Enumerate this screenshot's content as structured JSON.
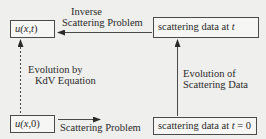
{
  "diagram": {
    "type": "flow",
    "nodes": {
      "u_xt": {
        "prefix": "u(",
        "var1": "x",
        "sep": ", ",
        "var2": "t",
        "suffix": ")"
      },
      "u_x0": {
        "prefix": "u(",
        "var1": "x",
        "sep": ", ",
        "var2": "0",
        "suffix": ")"
      },
      "scat_t": {
        "text": "scattering data at ",
        "var": "t"
      },
      "scat_t0": {
        "text": "scattering data at ",
        "var": "t",
        "tail": " = 0"
      }
    },
    "edges": {
      "inverse": {
        "line1": "Inverse",
        "line2": "Scattering Problem",
        "from": "scattering data at t",
        "to": "u(x, t)",
        "style": "solid"
      },
      "forward": {
        "line1": "Scattering Problem",
        "from": "u(x, 0)",
        "to": "scattering data at t = 0",
        "style": "solid"
      },
      "kdv": {
        "line1": "Evolution by",
        "line2": "KdV Equation",
        "from": "u(x, 0)",
        "to": "u(x, t)",
        "style": "dashed"
      },
      "scat_evo": {
        "line1": "Evolution of",
        "line2": "Scattering Data",
        "from": "scattering data at t = 0",
        "to": "scattering data at t",
        "style": "solid"
      }
    },
    "colors": {
      "background": "#efefed",
      "stroke": "#4a4a4a",
      "text": "#2a2a2a"
    }
  }
}
